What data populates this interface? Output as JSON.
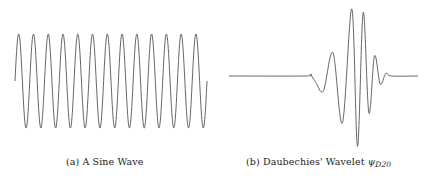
{
  "figure": {
    "panels": [
      {
        "id": "a",
        "caption_label": "(a) A Sine Wave",
        "plot": {
          "type": "line",
          "description": "sine wave",
          "cycles": 13,
          "stroke": "#555555"
        }
      },
      {
        "id": "b",
        "caption_prefix": "(b) Daubechies' Wavelet ",
        "caption_symbol": "ψ",
        "caption_subscript": "D20",
        "plot": {
          "type": "line",
          "description": "Daubechies D20 wavelet function",
          "stroke": "#555555"
        }
      }
    ]
  },
  "chart_data": [
    {
      "type": "line",
      "title": "(a) A Sine Wave",
      "xlabel": "",
      "ylabel": "",
      "grid": false,
      "axes_visible": false,
      "series": [
        {
          "name": "sin",
          "cycles": 13,
          "amplitude": 1,
          "phase_start": 0
        }
      ],
      "ylim": [
        -1,
        1
      ]
    },
    {
      "type": "line",
      "title": "(b) Daubechies' Wavelet ψ_D20",
      "xlabel": "",
      "ylabel": "",
      "grid": false,
      "axes_visible": false,
      "series": [
        {
          "name": "psi_D20",
          "points_normalized": [
            [
              0.0,
              0.0
            ],
            [
              0.4,
              0.0
            ],
            [
              0.43,
              0.02
            ],
            [
              0.46,
              -0.1
            ],
            [
              0.5,
              -0.22
            ],
            [
              0.55,
              0.35
            ],
            [
              0.6,
              -0.7
            ],
            [
              0.65,
              1.0
            ],
            [
              0.68,
              -1.05
            ],
            [
              0.71,
              0.95
            ],
            [
              0.74,
              -0.55
            ],
            [
              0.77,
              0.3
            ],
            [
              0.8,
              -0.12
            ],
            [
              0.83,
              0.04
            ],
            [
              0.86,
              0.0
            ],
            [
              1.0,
              0.0
            ]
          ]
        }
      ],
      "ylim": [
        -1.1,
        1.1
      ]
    }
  ]
}
